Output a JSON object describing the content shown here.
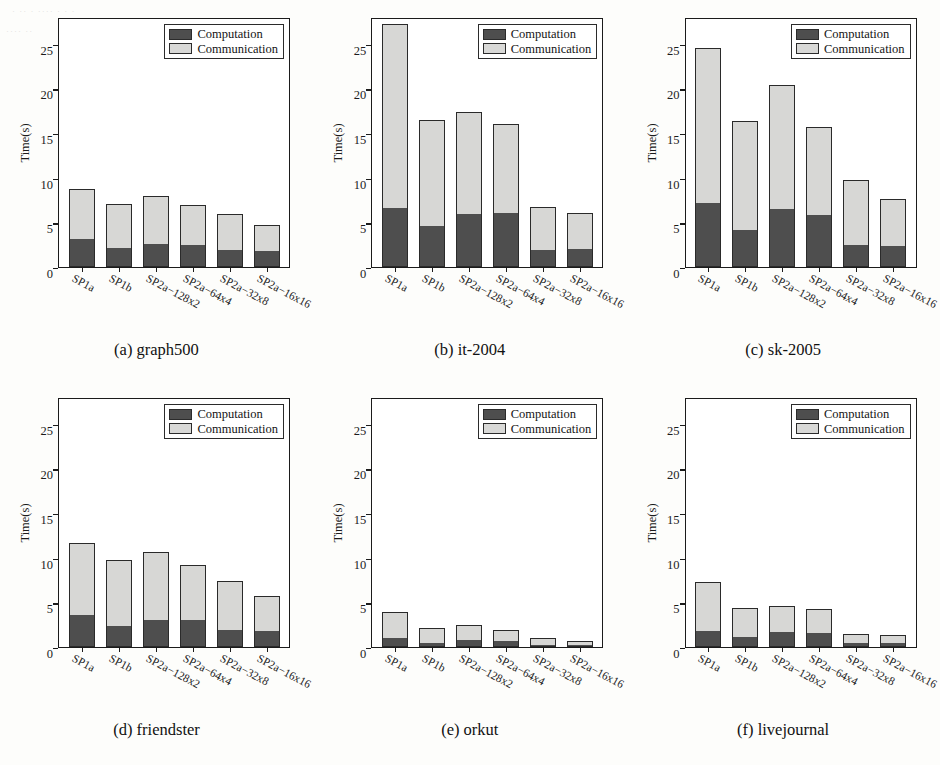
{
  "figure": {
    "legend": {
      "computation_label": "Computation",
      "communication_label": "Communication"
    },
    "axis": {
      "ylabel": "Time(s)",
      "yticks": [
        "0",
        "5",
        "10",
        "15",
        "20",
        "25"
      ],
      "ymin": 0,
      "ymax": 28
    },
    "categories": [
      "SP1a",
      "SP1b",
      "SP2a−128x2",
      "SP2a−64x4",
      "SP2a−32x8",
      "SP2a−16x16"
    ],
    "colors": {
      "computation": "#4e4e4e",
      "communication": "#d7d7d5",
      "axis": "#1b1b1b"
    },
    "captions": {
      "a": "(a) graph500",
      "b": "(b) it-2004",
      "c": "(c) sk-2005",
      "d": "(d) friendster",
      "e": "(e) orkut",
      "f": "(f) livejournal"
    },
    "scan_noise": {
      "top_left_1": "· ·· · ···· · · ·",
      "top_left_2": "···· ··"
    }
  },
  "chart_data": [
    {
      "type": "bar",
      "id": "a",
      "title": "(a) graph500",
      "xlabel": "",
      "ylabel": "Time(s)",
      "ylim": [
        0,
        28
      ],
      "yticks": [
        0,
        5,
        10,
        15,
        20,
        25
      ],
      "grid": false,
      "stacked": true,
      "legend_position": "top-right",
      "categories": [
        "SP1a",
        "SP1b",
        "SP2a−128x2",
        "SP2a−64x4",
        "SP2a−32x8",
        "SP2a−16x16"
      ],
      "series": [
        {
          "name": "Computation",
          "values": [
            3.1,
            2.1,
            2.6,
            2.5,
            1.9,
            1.8
          ]
        },
        {
          "name": "Communication",
          "values": [
            5.6,
            5.0,
            5.3,
            4.4,
            4.0,
            2.9
          ]
        }
      ],
      "totals": [
        8.7,
        7.1,
        7.9,
        6.9,
        5.9,
        4.7
      ]
    },
    {
      "type": "bar",
      "id": "b",
      "title": "(b) it-2004",
      "xlabel": "",
      "ylabel": "Time(s)",
      "ylim": [
        0,
        28
      ],
      "yticks": [
        0,
        5,
        10,
        15,
        20,
        25
      ],
      "grid": false,
      "stacked": true,
      "legend_position": "top-right",
      "categories": [
        "SP1a",
        "SP1b",
        "SP2a−128x2",
        "SP2a−64x4",
        "SP2a−32x8",
        "SP2a−16x16"
      ],
      "series": [
        {
          "name": "Computation",
          "values": [
            6.6,
            4.6,
            5.9,
            6.1,
            1.9,
            2.0
          ]
        },
        {
          "name": "Communication",
          "values": [
            20.6,
            11.9,
            11.5,
            9.9,
            4.8,
            4.1
          ]
        }
      ],
      "totals": [
        27.2,
        16.5,
        17.4,
        16.0,
        6.7,
        6.1
      ]
    },
    {
      "type": "bar",
      "id": "c",
      "title": "(c) sk-2005",
      "xlabel": "",
      "ylabel": "Time(s)",
      "ylim": [
        0,
        28
      ],
      "yticks": [
        0,
        5,
        10,
        15,
        20,
        25
      ],
      "grid": false,
      "stacked": true,
      "legend_position": "top-right",
      "categories": [
        "SP1a",
        "SP1b",
        "SP2a−128x2",
        "SP2a−64x4",
        "SP2a−32x8",
        "SP2a−16x16"
      ],
      "series": [
        {
          "name": "Computation",
          "values": [
            7.2,
            4.2,
            6.5,
            5.8,
            2.5,
            2.4
          ]
        },
        {
          "name": "Communication",
          "values": [
            17.3,
            12.2,
            13.9,
            9.9,
            7.3,
            5.2
          ]
        }
      ],
      "totals": [
        24.5,
        16.4,
        20.4,
        15.7,
        9.8,
        7.6
      ]
    },
    {
      "type": "bar",
      "id": "d",
      "title": "(d) friendster",
      "xlabel": "",
      "ylabel": "Time(s)",
      "ylim": [
        0,
        28
      ],
      "yticks": [
        0,
        5,
        10,
        15,
        20,
        25
      ],
      "grid": false,
      "stacked": true,
      "legend_position": "top-right",
      "categories": [
        "SP1a",
        "SP1b",
        "SP2a−128x2",
        "SP2a−64x4",
        "SP2a−32x8",
        "SP2a−16x16"
      ],
      "series": [
        {
          "name": "Computation",
          "values": [
            3.6,
            2.3,
            3.0,
            3.0,
            1.9,
            1.8
          ]
        },
        {
          "name": "Communication",
          "values": [
            8.1,
            7.5,
            7.6,
            6.2,
            5.5,
            3.9
          ]
        }
      ],
      "totals": [
        11.7,
        9.8,
        10.6,
        9.2,
        7.4,
        5.7
      ]
    },
    {
      "type": "bar",
      "id": "e",
      "title": "(e) orkut",
      "xlabel": "",
      "ylabel": "Time(s)",
      "ylim": [
        0,
        28
      ],
      "yticks": [
        0,
        5,
        10,
        15,
        20,
        25
      ],
      "grid": false,
      "stacked": true,
      "legend_position": "top-right",
      "categories": [
        "SP1a",
        "SP1b",
        "SP2a−128x2",
        "SP2a−64x4",
        "SP2a−32x8",
        "SP2a−16x16"
      ],
      "series": [
        {
          "name": "Computation",
          "values": [
            1.0,
            0.4,
            0.8,
            0.7,
            0.2,
            0.2
          ]
        },
        {
          "name": "Communication",
          "values": [
            2.9,
            1.7,
            1.7,
            1.2,
            0.8,
            0.5
          ]
        }
      ],
      "totals": [
        3.9,
        2.1,
        2.5,
        1.9,
        1.0,
        0.7
      ]
    },
    {
      "type": "bar",
      "id": "f",
      "title": "(f) livejournal",
      "xlabel": "",
      "ylabel": "Time(s)",
      "ylim": [
        0,
        28
      ],
      "yticks": [
        0,
        5,
        10,
        15,
        20,
        25
      ],
      "grid": false,
      "stacked": true,
      "legend_position": "top-right",
      "categories": [
        "SP1a",
        "SP1b",
        "SP2a−128x2",
        "SP2a−64x4",
        "SP2a−32x8",
        "SP2a−16x16"
      ],
      "series": [
        {
          "name": "Computation",
          "values": [
            1.8,
            1.1,
            1.7,
            1.6,
            0.5,
            0.4
          ]
        },
        {
          "name": "Communication",
          "values": [
            5.5,
            3.3,
            2.9,
            2.7,
            1.0,
            0.9
          ]
        }
      ],
      "totals": [
        7.3,
        4.4,
        4.6,
        4.3,
        1.5,
        1.3
      ]
    }
  ]
}
